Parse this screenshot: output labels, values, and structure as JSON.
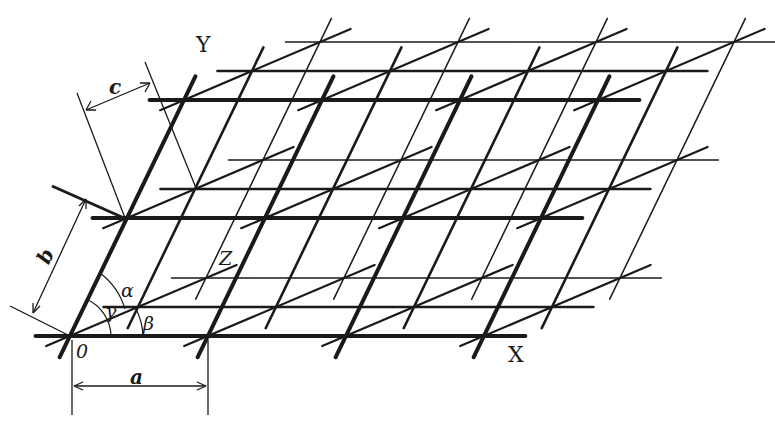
{
  "figure": {
    "colors": {
      "ink": "#1a1a1a",
      "background": "#ffffff"
    }
  },
  "lattice": {
    "origin": [
      70,
      336
    ],
    "a_vector": [
      138,
      0
    ],
    "b_vector": [
      57,
      -118
    ],
    "c_vector": [
      68,
      -29
    ],
    "count_a": 4,
    "count_b": 3,
    "count_c": 3,
    "layer_stroke_widths": [
      4,
      2.6,
      1.5
    ]
  },
  "labels": {
    "axis_x": "X",
    "axis_y": "Y",
    "axis_z": "Z",
    "origin": "0",
    "edge_a": "a",
    "edge_b": "b",
    "edge_c": "c",
    "angle_alpha": "α",
    "angle_beta": "β",
    "angle_gamma": "γ"
  }
}
